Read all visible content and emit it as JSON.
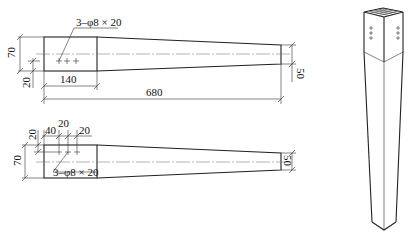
{
  "drawing": {
    "top_view": {
      "hole_callout": "3–φ8 × 20",
      "dim_height": "70",
      "dim_offset": "20",
      "dim_head_length": "140",
      "dim_total_length": "680",
      "dim_end_height": "50"
    },
    "bottom_view": {
      "hole_callout": "3–φ8 × 20",
      "dim_height": "70",
      "dim_offset": "20",
      "dim_first": "40",
      "dim_spacing_1": "20",
      "dim_spacing_2": "20",
      "dim_end_height": "50"
    },
    "isometric_view": {
      "description": "tapered square leg"
    }
  }
}
